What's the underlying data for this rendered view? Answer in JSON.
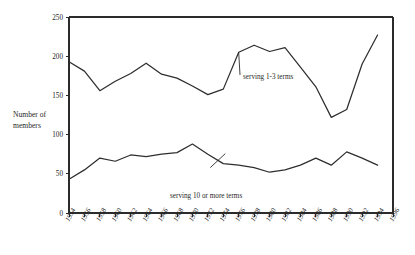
{
  "chart_data": {
    "type": "line",
    "title": "",
    "subtitle": "",
    "xlabel": "",
    "ylabel": "Number of members",
    "ylabel_lines": [
      "Number of",
      "members"
    ],
    "xlim": [
      1954,
      1996
    ],
    "ylim": [
      0,
      250
    ],
    "grid": false,
    "legend_position": "inline-annotations",
    "ytick_labels": [
      "0",
      "50",
      "100",
      "150",
      "200",
      "250"
    ],
    "ytick_values": [
      0,
      50,
      100,
      150,
      200,
      250
    ],
    "categories": [
      "1954",
      "1956",
      "1958",
      "1960",
      "1962",
      "1964",
      "1966",
      "1968",
      "1970",
      "1972",
      "1974",
      "1976",
      "1978",
      "1980",
      "1982",
      "1984",
      "1986",
      "1988",
      "1990",
      "1992",
      "1994",
      "1996"
    ],
    "x": [
      1954,
      1956,
      1958,
      1960,
      1962,
      1964,
      1966,
      1968,
      1970,
      1972,
      1974,
      1976,
      1978,
      1980,
      1982,
      1984,
      1986,
      1988,
      1990,
      1992,
      1994,
      1996
    ],
    "series": [
      {
        "name": "serving 1-3 terms",
        "label": "serving 1-3 terms",
        "values": [
          193,
          181,
          156,
          168,
          178,
          191,
          177,
          172,
          162,
          151,
          158,
          205,
          214,
          206,
          211,
          186,
          161,
          122,
          132,
          190,
          227,
          null
        ]
      },
      {
        "name": "serving 10 or more terms",
        "label": "serving 10 or more terms",
        "values": [
          43,
          55,
          70,
          66,
          74,
          72,
          75,
          77,
          88,
          75,
          63,
          61,
          58,
          52,
          55,
          61,
          70,
          61,
          78,
          70,
          61,
          null
        ]
      }
    ],
    "annotations": [
      {
        "text": "serving 1-3 terms",
        "series": "serving 1-3 terms"
      },
      {
        "text": "serving 10 or more terms",
        "series": "serving 10 or more terms"
      }
    ],
    "colors": {
      "line": "#2e2e2e",
      "axis": "#2b2b2b",
      "text": "#1f1f1f",
      "background": "#ffffff"
    }
  }
}
